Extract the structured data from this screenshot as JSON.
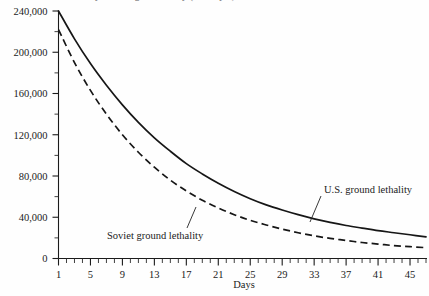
{
  "figure": {
    "clipped_title": "Ground lethality for a single battle day (1 = Day 1)",
    "background_color": "#fefefe",
    "ink_color": "#161616"
  },
  "chart_data": {
    "type": "line",
    "title": "",
    "xlabel": "Days",
    "ylabel": "",
    "xlim": [
      1,
      47
    ],
    "ylim": [
      0,
      240000
    ],
    "grid": false,
    "legend_position": "inline-annotations",
    "x_tick_labels": [
      "1",
      "5",
      "9",
      "13",
      "17",
      "21",
      "25",
      "29",
      "33",
      "37",
      "41",
      "45"
    ],
    "x_tick_values": [
      1,
      5,
      9,
      13,
      17,
      21,
      25,
      29,
      33,
      37,
      41,
      45
    ],
    "x_minor_tick_step": 1,
    "y_tick_labels": [
      "0",
      "40,000",
      "80,000",
      "120,000",
      "160,000",
      "200,000",
      "240,000"
    ],
    "y_tick_values": [
      0,
      40000,
      80000,
      120000,
      160000,
      200000,
      240000
    ],
    "y_minor_tick_step": 20000,
    "x": [
      1,
      3,
      5,
      7,
      9,
      11,
      13,
      15,
      17,
      19,
      21,
      23,
      25,
      27,
      29,
      31,
      33,
      35,
      37,
      39,
      41,
      43,
      45,
      47
    ],
    "series": [
      {
        "name": "U.S. ground lethality",
        "style": "solid",
        "values": [
          240000,
          213000,
          189000,
          168000,
          149000,
          132000,
          117000,
          104000,
          92000,
          82000,
          73000,
          65000,
          58000,
          52000,
          47000,
          42500,
          38500,
          35000,
          32000,
          29500,
          27000,
          25000,
          23000,
          21000
        ]
      },
      {
        "name": "Soviet ground lethality",
        "style": "dashed",
        "values": [
          222000,
          190000,
          163000,
          140000,
          120000,
          103000,
          88500,
          76000,
          65500,
          56500,
          49000,
          42500,
          37000,
          32500,
          28500,
          25000,
          22000,
          19500,
          17500,
          15500,
          14000,
          12500,
          11500,
          10500
        ]
      }
    ],
    "annotations": [
      {
        "label": "U.S. ground lethality",
        "target_series": "U.S. ground lethality",
        "leader_line": true
      },
      {
        "label": "Soviet ground lethality",
        "target_series": "Soviet ground lethality",
        "leader_line": true
      }
    ]
  }
}
